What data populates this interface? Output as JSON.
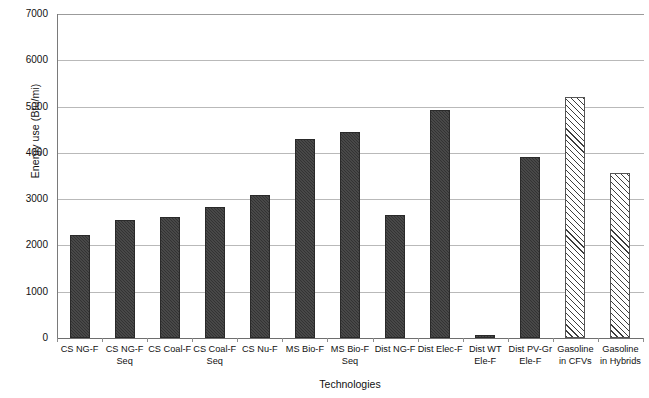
{
  "chart_data": {
    "type": "bar",
    "title": "",
    "xlabel": "Technologies",
    "ylabel": "Energy use (Btu/mi)",
    "ylim": [
      0,
      7000
    ],
    "ytick_labels": [
      "7000",
      "6000",
      "5000",
      "4000",
      "3000",
      "2000",
      "1000",
      "0"
    ],
    "ytick_values": [
      7000,
      6000,
      5000,
      4000,
      3000,
      2000,
      1000,
      0
    ],
    "grid": true,
    "legend": "none",
    "categories": [
      "CS NG-F",
      "CS NG-F Seq",
      "CS Coal-F",
      "CS Coal-F Seq",
      "CS Nu-F",
      "MS Bio-F",
      "MS Bio-F Seq",
      "Dist NG-F",
      "Dist Elec-F",
      "Dist WT Ele-F",
      "Dist PV-Gr Ele-F",
      "Gasoline in CFVs",
      "Gasoline in Hybrids"
    ],
    "category_lines": [
      [
        "CS NG-F",
        ""
      ],
      [
        "CS NG-F",
        "Seq"
      ],
      [
        "CS Coal-F",
        ""
      ],
      [
        "CS Coal-F",
        "Seq"
      ],
      [
        "CS Nu-F",
        ""
      ],
      [
        "MS Bio-F",
        ""
      ],
      [
        "MS Bio-F",
        "Seq"
      ],
      [
        "Dist NG-F",
        ""
      ],
      [
        "Dist Elec-F",
        ""
      ],
      [
        "Dist WT",
        "Ele-F"
      ],
      [
        "Dist PV-Gr",
        "Ele-F"
      ],
      [
        "Gasoline",
        "in CFVs"
      ],
      [
        "Gasoline",
        "in Hybrids"
      ]
    ],
    "values": [
      2230,
      2560,
      2620,
      2840,
      3080,
      4300,
      4460,
      2650,
      4930,
      70,
      3920,
      5210,
      3570
    ],
    "styles": [
      "solid",
      "solid",
      "solid",
      "solid",
      "solid",
      "solid",
      "solid",
      "solid",
      "solid",
      "solid",
      "solid",
      "hatched",
      "hatched"
    ],
    "colors": {
      "solid_fill": "#333333",
      "hatched_fill": "#ffffff",
      "hatch_stroke": "#3d3d3d",
      "gridline": "#b9b9b9",
      "axis": "#6e6e6e",
      "background": "#ffffff",
      "text": "#111111"
    }
  }
}
